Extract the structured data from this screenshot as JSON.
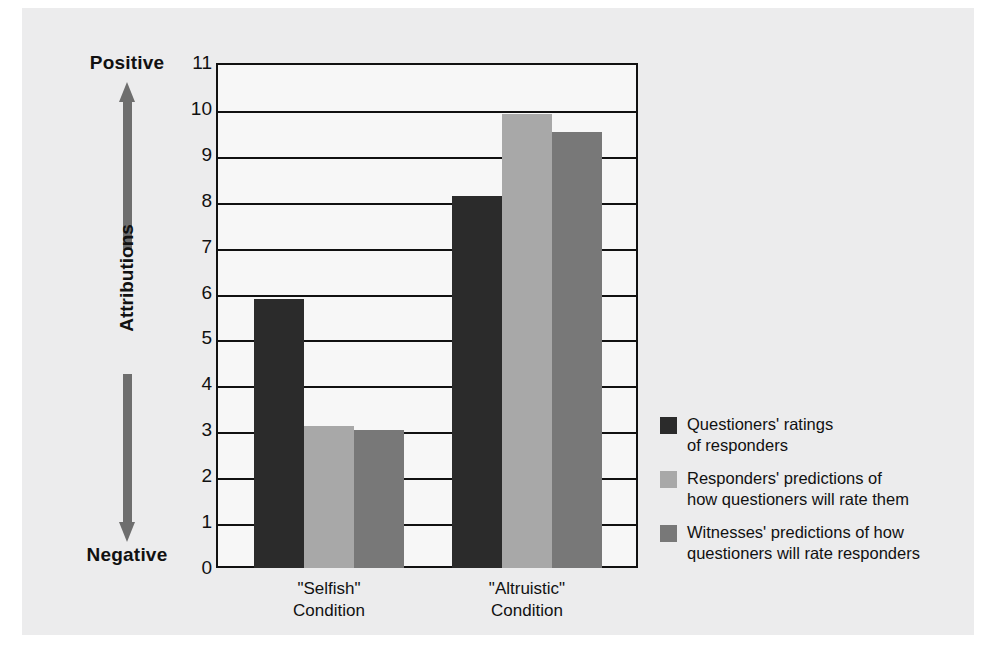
{
  "chart_data": {
    "type": "bar",
    "title": "",
    "xlabel": "",
    "ylabel": "Attributions",
    "ylim": [
      0,
      11
    ],
    "ytick_step": 1,
    "grid": true,
    "legend_position": "right",
    "categories": [
      "\"Selfish\"\nCondition",
      "\"Altruistic\"\nCondition"
    ],
    "category_lines": [
      [
        "\"Selfish\"",
        "Condition"
      ],
      [
        "\"Altruistic\"",
        "Condition"
      ]
    ],
    "ytick_labels": [
      "11",
      "10",
      "9",
      "8",
      "7",
      "6",
      "5",
      "4",
      "3",
      "2",
      "1",
      "0"
    ],
    "ytick_values": [
      11,
      10,
      9,
      8,
      7,
      6,
      5,
      4,
      3,
      2,
      1,
      0
    ],
    "series": [
      {
        "name": "Questioners' ratings of responders",
        "legend_lines": [
          "Questioners' ratings",
          "of responders"
        ],
        "color": "#2b2b2b",
        "values": [
          5.85,
          8.1
        ]
      },
      {
        "name": "Responders' predictions of how questioners will rate them",
        "legend_lines": [
          "Responders' predictions of",
          "how questioners will rate them"
        ],
        "color": "#a8a8a8",
        "values": [
          3.1,
          9.9
        ]
      },
      {
        "name": "Witnesses' predictions of how questioners will rate responders",
        "legend_lines": [
          "Witnesses' predictions of how",
          "questioners will rate responders"
        ],
        "color": "#787878",
        "values": [
          3.0,
          9.5
        ]
      }
    ],
    "annotations": {
      "axis_pole_high": "Positive",
      "axis_pole_low": "Negative",
      "axis_direction_arrow": "double-vertical"
    }
  },
  "style": {
    "panel_background": "#ececed",
    "plot_background": "#f7f7f7",
    "axis_color": "#111111",
    "arrow_color": "#6e6e6e"
  }
}
